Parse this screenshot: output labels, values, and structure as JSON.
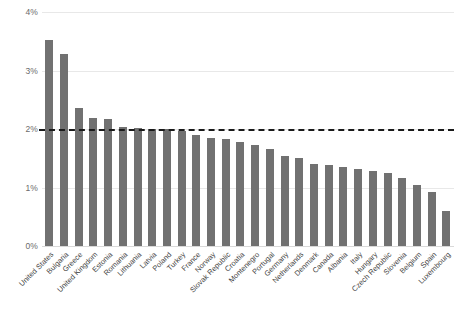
{
  "chart_data": {
    "type": "bar",
    "title": "",
    "subtitle": "",
    "xlabel": "",
    "ylabel": "",
    "ylim": [
      0,
      4
    ],
    "ytick_labels": [
      "4%",
      "3%",
      "2%",
      "1%",
      "0%"
    ],
    "yticks": [
      4,
      3,
      2,
      1,
      0
    ],
    "grid": true,
    "legend_position": "none",
    "value_suffix": "%",
    "bar_color": "#717171",
    "gridline_color": "#e8e8e8",
    "reference_line": {
      "label": "2% target",
      "value": 2,
      "style": "dashed",
      "color": "#1a1a1a"
    },
    "categories": [
      "United States",
      "Bulgaria",
      "Greece",
      "United Kingdom",
      "Estonia",
      "Romania",
      "Lithuania",
      "Latvia",
      "Poland",
      "Turkey",
      "France",
      "Norway",
      "Slovak Republic",
      "Croatia",
      "Montenegro",
      "Portugal",
      "Germany",
      "Netherlands",
      "Denmark",
      "Canada",
      "Albania",
      "Italy",
      "Hungary",
      "Czech Republic",
      "Slovenia",
      "Belgium",
      "Spain",
      "Luxembourg"
    ],
    "values": [
      3.52,
      3.28,
      2.36,
      2.19,
      2.17,
      2.04,
      2.01,
      2.0,
      2.0,
      1.96,
      1.89,
      1.85,
      1.83,
      1.78,
      1.73,
      1.66,
      1.54,
      1.5,
      1.41,
      1.39,
      1.35,
      1.31,
      1.28,
      1.24,
      1.16,
      1.05,
      0.93,
      0.6
    ]
  }
}
